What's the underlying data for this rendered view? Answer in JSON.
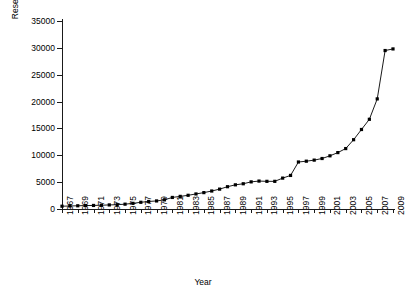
{
  "chart_data": {
    "type": "line",
    "title": "",
    "xlabel": "Year",
    "ylabel": "Research Output",
    "xlim": [
      1967,
      2009
    ],
    "ylim": [
      0,
      35000
    ],
    "ytick_values": [
      0,
      5000,
      10000,
      15000,
      20000,
      25000,
      30000,
      35000
    ],
    "ytick_labels": [
      "0",
      "5000",
      "10000",
      "15000",
      "20000",
      "25000",
      "30000",
      "35000"
    ],
    "xtick_labels": [
      "1967",
      "1969",
      "1971",
      "1973",
      "1975",
      "1977",
      "1979",
      "1981",
      "1983",
      "1985",
      "1987",
      "1989",
      "1991",
      "1993",
      "1995",
      "1997",
      "1999",
      "2001",
      "2003",
      "2005",
      "2007",
      "2009"
    ],
    "grid": false,
    "legend": false,
    "marker": "square",
    "line_color": "#000000",
    "marker_color": "#000000",
    "x": [
      1967,
      1968,
      1969,
      1970,
      1971,
      1972,
      1973,
      1974,
      1975,
      1976,
      1977,
      1978,
      1979,
      1980,
      1981,
      1982,
      1983,
      1984,
      1985,
      1986,
      1987,
      1988,
      1989,
      1990,
      1991,
      1992,
      1993,
      1994,
      1995,
      1996,
      1997,
      1998,
      1999,
      2000,
      2001,
      2002,
      2003,
      2004,
      2005,
      2006,
      2007,
      2008,
      2009
    ],
    "values": [
      520,
      560,
      600,
      640,
      660,
      700,
      760,
      800,
      900,
      1050,
      1250,
      1400,
      1500,
      1700,
      2150,
      2350,
      2550,
      2800,
      3050,
      3350,
      3700,
      4150,
      4500,
      4700,
      5050,
      5200,
      5150,
      5150,
      5750,
      6250,
      8750,
      8900,
      9100,
      9400,
      9900,
      10500,
      11250,
      12900,
      14800,
      16700,
      20500,
      29500,
      29800
    ]
  }
}
